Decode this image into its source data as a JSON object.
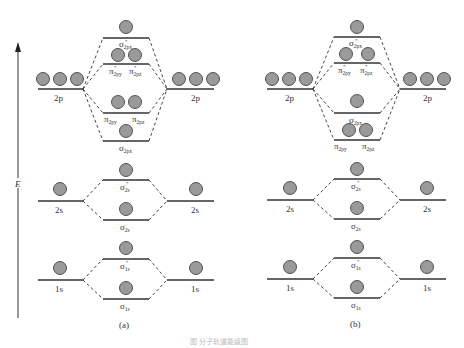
{
  "axis": {
    "label": "E"
  },
  "panels": [
    {
      "label": "(a)",
      "atomic_left": [
        {
          "label": "2p",
          "electrons": 3
        },
        {
          "label": "2s",
          "electrons": 1
        },
        {
          "label": "1s",
          "electrons": 1
        }
      ],
      "atomic_right": [
        {
          "label": "2p",
          "electrons": 3
        },
        {
          "label": "2s",
          "electrons": 1
        },
        {
          "label": "1s",
          "electrons": 1
        }
      ],
      "molecular_orbitals": [
        {
          "symbol": "σ",
          "star": "*",
          "sub": "2px",
          "electrons": 1
        },
        {
          "symbol": "π",
          "star": "*",
          "sub": "2py / 2pz",
          "labels": [
            "π*2py",
            "π*2pz"
          ],
          "electrons": 2
        },
        {
          "symbol": "π",
          "sub": "2py / 2pz",
          "labels": [
            "π2py",
            "π2pz"
          ],
          "electrons": 2
        },
        {
          "symbol": "σ",
          "sub": "2px",
          "electrons": 1
        },
        {
          "symbol": "σ",
          "star": "*",
          "sub": "2s",
          "electrons": 1
        },
        {
          "symbol": "σ",
          "sub": "2s",
          "electrons": 1
        },
        {
          "symbol": "σ",
          "star": "*",
          "sub": "1s",
          "electrons": 1
        },
        {
          "symbol": "σ",
          "sub": "1s",
          "electrons": 1
        }
      ]
    },
    {
      "label": "(b)",
      "atomic_left": [
        {
          "label": "2p",
          "electrons": 3
        },
        {
          "label": "2s",
          "electrons": 1
        },
        {
          "label": "1s",
          "electrons": 1
        }
      ],
      "atomic_right": [
        {
          "label": "2p",
          "electrons": 3
        },
        {
          "label": "2s",
          "electrons": 1
        },
        {
          "label": "1s",
          "electrons": 1
        }
      ],
      "molecular_orbitals": [
        {
          "symbol": "σ",
          "star": "*",
          "sub": "2px",
          "electrons": 1
        },
        {
          "symbol": "π",
          "star": "*",
          "sub": "2py / 2pz",
          "labels": [
            "π*2py",
            "π*2pz"
          ],
          "electrons": 2
        },
        {
          "symbol": "σ",
          "sub": "2px",
          "electrons": 1
        },
        {
          "symbol": "π",
          "sub": "2py / 2pz",
          "labels": [
            "π2py",
            "π2pz"
          ],
          "electrons": 2
        },
        {
          "symbol": "σ",
          "star": "*",
          "sub": "2s",
          "electrons": 1
        },
        {
          "symbol": "σ",
          "sub": "2s",
          "electrons": 1
        },
        {
          "symbol": "σ",
          "star": "*",
          "sub": "1s",
          "electrons": 1
        },
        {
          "symbol": "σ",
          "sub": "1s",
          "electrons": 1
        }
      ]
    }
  ],
  "text": {
    "label_2p": "2p",
    "label_2s": "2s",
    "label_1s": "1s",
    "sigma": "σ",
    "pi": "π",
    "star": "*",
    "sub_2px": "2px",
    "sub_2py": "2py",
    "sub_2pz": "2pz",
    "sub_2s": "2s",
    "sub_1s": "1s",
    "panel_a": "(a)",
    "panel_b": "(b)",
    "caption": "图 分子轨道能级图"
  }
}
